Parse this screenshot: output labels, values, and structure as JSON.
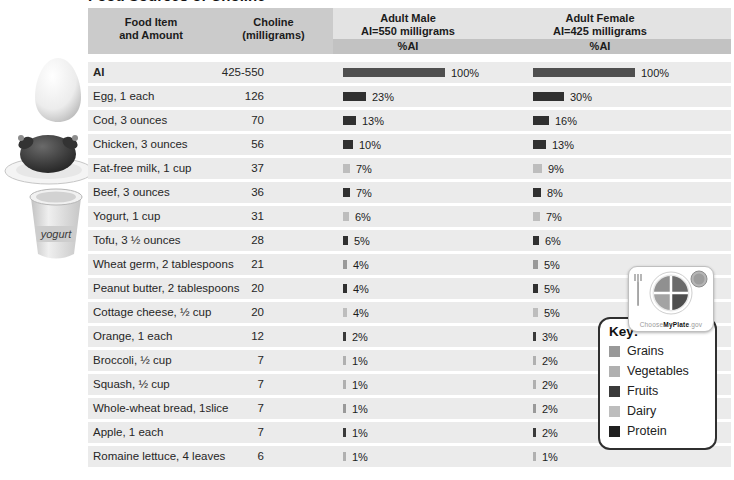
{
  "title": "Food Sources of Choline",
  "header": {
    "food": {
      "line1": "Food Item",
      "line2": "and Amount"
    },
    "choline": {
      "line1": "Choline",
      "line2": "(milligrams)"
    },
    "male": {
      "line1": "Adult Male",
      "line2": "AI=550 milligrams",
      "sub": "%AI"
    },
    "female": {
      "line1": "Adult Female",
      "line2": "AI=425 milligrams",
      "sub": "%AI"
    }
  },
  "rows": [
    {
      "name": "AI",
      "bold": true,
      "choline": "425-550",
      "male": 100,
      "female": 100,
      "group": "reference"
    },
    {
      "name": "Egg, 1 each",
      "choline": "126",
      "male": 23,
      "female": 30,
      "group": "protein"
    },
    {
      "name": "Cod, 3 ounces",
      "choline": "70",
      "male": 13,
      "female": 16,
      "group": "protein"
    },
    {
      "name": "Chicken, 3 ounces",
      "choline": "56",
      "male": 10,
      "female": 13,
      "group": "protein"
    },
    {
      "name": "Fat-free milk, 1 cup",
      "choline": "37",
      "male": 7,
      "female": 9,
      "group": "dairy"
    },
    {
      "name": "Beef, 3 ounces",
      "choline": "36",
      "male": 7,
      "female": 8,
      "group": "protein"
    },
    {
      "name": "Yogurt, 1 cup",
      "choline": "31",
      "male": 6,
      "female": 7,
      "group": "dairy"
    },
    {
      "name": "Tofu, 3 ½ ounces",
      "choline": "28",
      "male": 5,
      "female": 6,
      "group": "protein"
    },
    {
      "name": "Wheat germ, 2 tablespoons",
      "choline": "21",
      "male": 4,
      "female": 5,
      "group": "grains"
    },
    {
      "name": "Peanut butter, 2 tablespoons",
      "choline": "20",
      "male": 4,
      "female": 5,
      "group": "protein"
    },
    {
      "name": "Cottage cheese, ½ cup",
      "choline": "20",
      "male": 4,
      "female": 5,
      "group": "dairy"
    },
    {
      "name": "Orange, 1 each",
      "choline": "12",
      "male": 2,
      "female": 3,
      "group": "fruits"
    },
    {
      "name": "Broccoli, ½ cup",
      "choline": "7",
      "male": 1,
      "female": 2,
      "group": "vegetables"
    },
    {
      "name": "Squash, ½ cup",
      "choline": "7",
      "male": 1,
      "female": 2,
      "group": "vegetables"
    },
    {
      "name": "Whole-wheat bread, 1slice",
      "choline": "7",
      "male": 1,
      "female": 2,
      "group": "grains"
    },
    {
      "name": "Apple, 1 each",
      "choline": "7",
      "male": 1,
      "female": 2,
      "group": "fruits"
    },
    {
      "name": "Romaine lettuce, 4 leaves",
      "choline": "6",
      "male": 1,
      "female": 1,
      "group": "vegetables"
    }
  ],
  "group_colors": {
    "reference": "#4f4f4f",
    "protein": "#303030",
    "dairy": "#bdbdbd",
    "grains": "#999999",
    "fruits": "#3a3a3a",
    "vegetables": "#b0b0b0"
  },
  "key": {
    "label": "Key:",
    "items": [
      {
        "name": "Grains",
        "color": "#999999"
      },
      {
        "name": "Vegetables",
        "color": "#b0b0b0"
      },
      {
        "name": "Fruits",
        "color": "#3a3a3a"
      },
      {
        "name": "Dairy",
        "color": "#bdbdbd"
      },
      {
        "name": "Protein",
        "color": "#1f1f1f"
      }
    ]
  },
  "logo": {
    "choose": "Choose",
    "myplate": "MyPlate",
    "gov": ".gov"
  },
  "images": {
    "yogurt_label": "yogurt"
  },
  "chart_data": {
    "type": "bar",
    "title": "Food Sources of Choline",
    "categories": [
      "AI",
      "Egg, 1 each",
      "Cod, 3 ounces",
      "Chicken, 3 ounces",
      "Fat-free milk, 1 cup",
      "Beef, 3 ounces",
      "Yogurt, 1 cup",
      "Tofu, 3 ½ ounces",
      "Wheat germ, 2 tablespoons",
      "Peanut butter, 2 tablespoons",
      "Cottage cheese, ½ cup",
      "Orange, 1 each",
      "Broccoli, ½ cup",
      "Squash, ½ cup",
      "Whole-wheat bread, 1slice",
      "Apple, 1 each",
      "Romaine lettuce, 4 leaves"
    ],
    "choline_mg": [
      "425-550",
      126,
      70,
      56,
      37,
      36,
      31,
      28,
      21,
      20,
      20,
      12,
      7,
      7,
      7,
      7,
      6
    ],
    "series": [
      {
        "name": "Adult Male %AI (AI=550 milligrams)",
        "values": [
          100,
          23,
          13,
          10,
          7,
          7,
          6,
          5,
          4,
          4,
          4,
          2,
          1,
          1,
          1,
          1,
          1
        ]
      },
      {
        "name": "Adult Female %AI (AI=425 milligrams)",
        "values": [
          100,
          30,
          16,
          13,
          9,
          8,
          7,
          6,
          5,
          5,
          5,
          3,
          2,
          2,
          2,
          2,
          1
        ]
      }
    ],
    "food_groups": [
      "reference",
      "protein",
      "protein",
      "protein",
      "dairy",
      "protein",
      "dairy",
      "protein",
      "grains",
      "protein",
      "dairy",
      "fruits",
      "vegetables",
      "vegetables",
      "grains",
      "fruits",
      "vegetables"
    ],
    "xlabel": "%AI",
    "xlim": [
      0,
      100
    ],
    "orientation": "horizontal",
    "legend": [
      "Grains",
      "Vegetables",
      "Fruits",
      "Dairy",
      "Protein"
    ],
    "legend_position": "right-overlay",
    "grid": false
  }
}
